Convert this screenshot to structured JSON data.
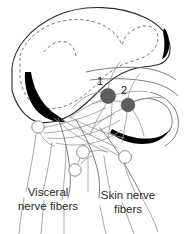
{
  "figure": {
    "background_color": "#ffffff",
    "width": 186,
    "height": 234
  },
  "markers": [
    {
      "id": "marker-1",
      "label": "1",
      "cx": 108,
      "cy": 96,
      "r": 7.5,
      "label_x": 100,
      "label_y": 85,
      "color": "#5e5e5e"
    },
    {
      "id": "marker-2",
      "label": "2",
      "cx": 128,
      "cy": 105,
      "r": 6.8,
      "label_x": 122,
      "label_y": 94,
      "color": "#5e5e5e"
    }
  ],
  "captions": {
    "visceral": "Visceral\nnerve fibers",
    "visceral_line1": "Visceral",
    "visceral_line2": "nerve fibers",
    "skin": "Skin nerve\nfibers",
    "skin_line1": "Skin nerve",
    "skin_line2": "fibers"
  },
  "structures": {
    "cord_outline_name": "spinal cord white matter outline",
    "gray_matter_name": "gray matter dashed boundary",
    "black_masses_name": "darkly stained tract regions",
    "ganglion_cells_name": "nerve cell bodies"
  },
  "colors": {
    "outline": "#2b2b2b",
    "gray_matter_dash": "#7a7a7a",
    "black_mass": "#000000",
    "fiber": "#9a9a9a",
    "neuron_soma": "#5e5e5e",
    "text": "#2a2a2a"
  },
  "ganglion_cells": [
    {
      "cx": 38,
      "cy": 127,
      "r": 6.2
    },
    {
      "cx": 83,
      "cy": 152,
      "r": 6.4
    },
    {
      "cx": 75,
      "cy": 170,
      "r": 6.2
    },
    {
      "cx": 125,
      "cy": 157,
      "r": 6.4
    }
  ]
}
